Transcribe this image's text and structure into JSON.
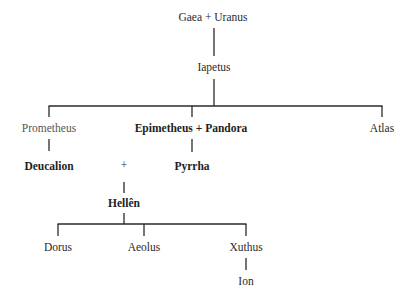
{
  "diagram": {
    "nodes": {
      "gaea_uranus": "Gaea + Uranus",
      "iapetus": "Iapetus",
      "prometheus": "Prometheus",
      "epimetheus_pandora": "Epimetheus + Pandora",
      "atlas": "Atlas",
      "deucalion": "Deucalion",
      "plus": "+",
      "pyrrha": "Pyrrha",
      "hellen": "Hellên",
      "dorus": "Dorus",
      "aeolus": "Aeolus",
      "xuthus": "Xuthus",
      "ion": "Ion"
    },
    "edges": [
      [
        "Gaea + Uranus",
        "Iapetus"
      ],
      [
        "Iapetus",
        "Prometheus"
      ],
      [
        "Iapetus",
        "Epimetheus + Pandora"
      ],
      [
        "Iapetus",
        "Atlas"
      ],
      [
        "Prometheus",
        "Deucalion"
      ],
      [
        "Epimetheus + Pandora",
        "Pyrrha"
      ],
      [
        "Deucalion + Pyrrha",
        "Hellên"
      ],
      [
        "Hellên",
        "Dorus"
      ],
      [
        "Hellên",
        "Aeolus"
      ],
      [
        "Hellên",
        "Xuthus"
      ],
      [
        "Xuthus",
        "Ion"
      ]
    ]
  }
}
